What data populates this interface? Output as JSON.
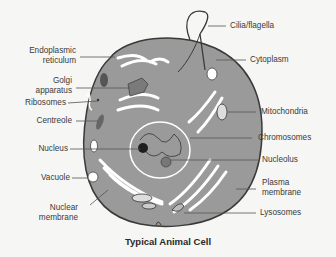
{
  "title": "Typical Animal Cell",
  "labels": {
    "cilia": "Cilia/flagella",
    "er_1": "Endoplasmic",
    "er_2": "reticulum",
    "golgi_1": "Golgi",
    "golgi_2": "apparatus",
    "ribosomes": "Ribosomes",
    "centreole": "Centreole",
    "nucleus": "Nucleus",
    "vacuole": "Vacuole",
    "nuclear_membrane_1": "Nuclear",
    "nuclear_membrane_2": "membrane",
    "cytoplasm": "Cytoplasm",
    "mitochondria": "Mitochondria",
    "chromosomes": "Chromosomes",
    "nucleolus": "Nucleolus",
    "plasma_membrane_1": "Plasma",
    "plasma_membrane_2": "membrane",
    "lysosomes": "Lysosomes"
  },
  "colors": {
    "background": "#f6f6f4",
    "cytoplasm": "#9a9a9a",
    "outline": "#3a3a3a",
    "organelle_light": "#ffffff",
    "organelle_dark": "#2a2a2a"
  }
}
